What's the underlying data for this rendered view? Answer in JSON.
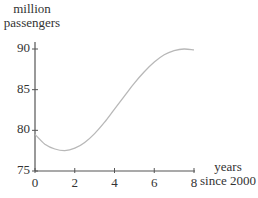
{
  "chart_data": {
    "type": "line",
    "title": "",
    "ylabel": "million passengers",
    "xlabel": "years since 2000",
    "ylabel_lines": [
      "million",
      "passengers"
    ],
    "xlabel_lines": [
      "years",
      "since 2000"
    ],
    "xlim": [
      0,
      8
    ],
    "ylim": [
      75,
      90
    ],
    "x_ticks": [
      0,
      2,
      4,
      6,
      8
    ],
    "y_ticks": [
      75,
      80,
      85,
      90
    ],
    "x_tick_labels": [
      "0",
      "2",
      "4",
      "6",
      "8"
    ],
    "y_tick_labels": [
      "75",
      "80",
      "85",
      "90"
    ],
    "grid": false,
    "legend": null,
    "series": [
      {
        "name": "passengers",
        "x": [
          0,
          0.5,
          1,
          1.5,
          2,
          2.5,
          3,
          3.5,
          4,
          4.5,
          5,
          5.5,
          6,
          6.5,
          7,
          7.5,
          8
        ],
        "y": [
          79.5,
          78.3,
          77.7,
          77.5,
          77.8,
          78.5,
          79.6,
          81.0,
          82.6,
          84.2,
          85.8,
          87.2,
          88.4,
          89.3,
          89.8,
          90.0,
          89.9
        ]
      }
    ],
    "colors": {
      "curve": "#b8b8b8",
      "axes": "#555555",
      "text": "#333333"
    }
  }
}
